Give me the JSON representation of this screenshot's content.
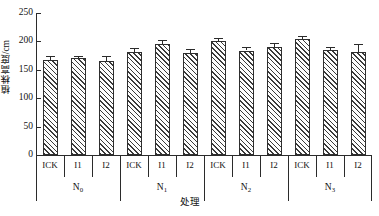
{
  "chart_data": {
    "type": "bar",
    "title": "",
    "xlabel": "处理",
    "ylabel": "植株高度/cm",
    "ylim": [
      0,
      250
    ],
    "yticks": [
      0,
      50,
      100,
      150,
      200,
      250
    ],
    "ytick_labels": [
      "0",
      "50",
      "100",
      "150",
      "200",
      "250"
    ],
    "grid": false,
    "legend": "none",
    "group_labels": [
      "N",
      "N",
      "N",
      "N"
    ],
    "group_subscripts": [
      "0",
      "1",
      "2",
      "3"
    ],
    "treatments": [
      "ICK",
      "I1",
      "I2"
    ],
    "categories": [
      "N0-ICK",
      "N0-I1",
      "N0-I2",
      "N1-ICK",
      "N1-I1",
      "N1-I2",
      "N2-ICK",
      "N2-I1",
      "N2-I2",
      "N3-ICK",
      "N3-I1",
      "N3-I2"
    ],
    "values": [
      168,
      170,
      165,
      181,
      196,
      179,
      201,
      184,
      190,
      205,
      185,
      182
    ],
    "errors": [
      7,
      4,
      10,
      7,
      6,
      8,
      5,
      7,
      7,
      5,
      6,
      13
    ],
    "bars": [
      {
        "group": "N0",
        "treatment": "ICK",
        "value": 168,
        "error": 7
      },
      {
        "group": "N0",
        "treatment": "I1",
        "value": 170,
        "error": 4
      },
      {
        "group": "N0",
        "treatment": "I2",
        "value": 165,
        "error": 10
      },
      {
        "group": "N1",
        "treatment": "ICK",
        "value": 181,
        "error": 7
      },
      {
        "group": "N1",
        "treatment": "I1",
        "value": 196,
        "error": 6
      },
      {
        "group": "N1",
        "treatment": "I2",
        "value": 179,
        "error": 8
      },
      {
        "group": "N2",
        "treatment": "ICK",
        "value": 201,
        "error": 5
      },
      {
        "group": "N2",
        "treatment": "I1",
        "value": 184,
        "error": 7
      },
      {
        "group": "N2",
        "treatment": "I2",
        "value": 190,
        "error": 7
      },
      {
        "group": "N3",
        "treatment": "ICK",
        "value": 205,
        "error": 5
      },
      {
        "group": "N3",
        "treatment": "I1",
        "value": 185,
        "error": 6
      },
      {
        "group": "N3",
        "treatment": "I2",
        "value": 182,
        "error": 13
      }
    ],
    "colors": {
      "axis": "#2b2b2b",
      "bar_edge": "#2e2e2e",
      "bar_fill": "#fdfdfd",
      "hatch": "#3a3a3a",
      "text": "#111111",
      "background": "#ffffff"
    }
  }
}
